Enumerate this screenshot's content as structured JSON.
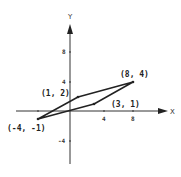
{
  "diagram": {
    "type": "coordinate-plane-parallelogram",
    "axes": {
      "x_label": "X",
      "y_label": "Y",
      "x_ticks": [
        "4",
        "8"
      ],
      "y_ticks": [
        "8",
        "4",
        "-4"
      ]
    },
    "points": [
      {
        "label": "(-4, -1)",
        "x": -4,
        "y": -1
      },
      {
        "label": "(1, 2)",
        "x": 1,
        "y": 2
      },
      {
        "label": "(8, 4)",
        "x": 8,
        "y": 4
      },
      {
        "label": "(3, 1)",
        "x": 3,
        "y": 1
      }
    ],
    "colors": {
      "line": "#222222",
      "axis": "#333333",
      "background": "#ffffff"
    }
  }
}
